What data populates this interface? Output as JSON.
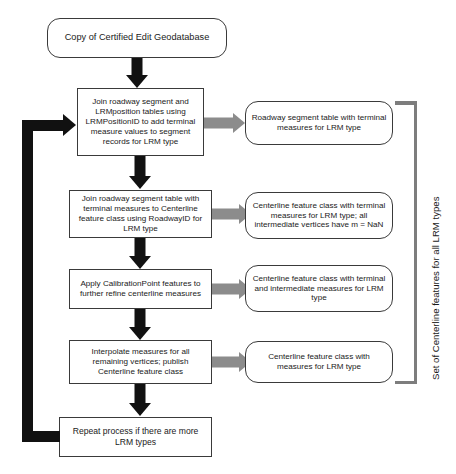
{
  "diagram": {
    "colors": {
      "flow_arrow": "#111111",
      "output_arrow": "#8c8c8c",
      "bracket": "#7d7d7d",
      "node_border": "#3a3a3a",
      "background": "#ffffff"
    },
    "start_node": {
      "label": "Copy of Certified Edit Geodatabase",
      "shape": "rounded-rectangle"
    },
    "steps": [
      {
        "id": "step-1",
        "label": "Join roadway segment and LRMposition tables using LRMPositionID to add terminal measure values to segment records for LRM type",
        "shape": "rectangle",
        "output": {
          "label": "Roadway segment table with terminal measures for LRM type",
          "shape": "rounded-rectangle"
        }
      },
      {
        "id": "step-2",
        "label": "Join roadway segment table with terminal measures to Centerline feature class using RoadwayID for LRM type",
        "shape": "rectangle",
        "output": {
          "label": "Centerline feature class with terminal measures for LRM type; all intermediate vertices have m = NaN",
          "shape": "rounded-rectangle"
        }
      },
      {
        "id": "step-3",
        "label": "Apply CalibrationPoint features to further refine centerline measures",
        "shape": "rectangle",
        "output": {
          "label": "Centerline feature class with terminal and intermediate measures for LRM type",
          "shape": "rounded-rectangle"
        }
      },
      {
        "id": "step-4",
        "label": "Interpolate measures for all remaining vertices; publish Centerline feature class",
        "shape": "rectangle",
        "output": {
          "label": "Centerline feature class with measures for LRM type",
          "shape": "rounded-rectangle"
        }
      }
    ],
    "loop_node": {
      "label": "Repeat process if there are more LRM types",
      "shape": "rectangle"
    },
    "bracket": {
      "label": "Set of Centerline features for all LRM types",
      "orientation": "vertical-right"
    }
  }
}
